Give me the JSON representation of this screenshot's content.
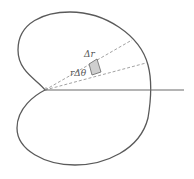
{
  "diagram": {
    "type": "polar-area-element",
    "curve": "cardioid",
    "labels": {
      "delta_r": "Δr",
      "r_delta_theta": "rΔθ"
    },
    "colors": {
      "curve": "#5a5a5a",
      "axis": "#6a6a6a",
      "rays": "#8a8a8a",
      "element_fill": "#cfcfcf",
      "background": "#ffffff"
    }
  }
}
